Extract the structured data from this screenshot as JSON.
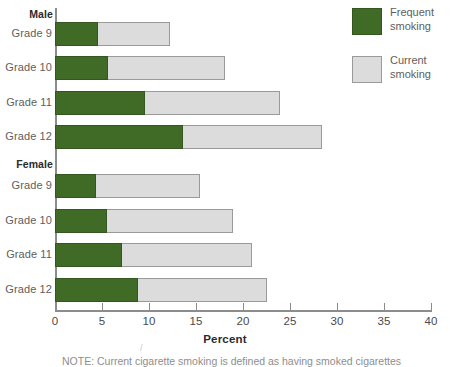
{
  "chart_data": {
    "type": "bar",
    "orientation": "horizontal",
    "stacked": true,
    "title": "",
    "xlabel": "Percent",
    "ylabel": "",
    "xlim": [
      0,
      40
    ],
    "xticks": [
      0,
      5,
      10,
      15,
      20,
      25,
      30,
      35,
      40
    ],
    "xtick_labels": [
      "0",
      "5",
      "10",
      "15",
      "20",
      "25",
      "30",
      "35",
      "40"
    ],
    "grid": false,
    "legend_position": "top-right",
    "groups": [
      {
        "name": "Male",
        "categories": [
          "Grade 9",
          "Grade 10",
          "Grade 11",
          "Grade 12"
        ]
      },
      {
        "name": "Female",
        "categories": [
          "Grade 9",
          "Grade 10",
          "Grade 11",
          "Grade 12"
        ]
      }
    ],
    "categories": [
      "Male Grade 9",
      "Male Grade 10",
      "Male Grade 11",
      "Male Grade 12",
      "Female Grade 9",
      "Female Grade 10",
      "Female Grade 11",
      "Female Grade 12"
    ],
    "series": [
      {
        "name": "Frequent smoking",
        "color": "#3f6b27",
        "values": [
          4.6,
          5.6,
          9.6,
          13.6,
          4.4,
          5.5,
          7.1,
          8.8
        ]
      },
      {
        "name": "Current smoking",
        "color": "#dcdcdc",
        "values": [
          12.2,
          18.1,
          23.9,
          28.4,
          15.4,
          18.9,
          21.0,
          22.6
        ],
        "note": "Values are cumulative bar ends (total current smoking)."
      }
    ]
  },
  "axis": {
    "xlabel": "Percent",
    "tick_labels": [
      "0",
      "5",
      "10",
      "15",
      "20",
      "25",
      "30",
      "35",
      "40"
    ]
  },
  "groups": {
    "male": {
      "header": "Male",
      "rows": [
        {
          "label": "Grade 9",
          "frequent": 4.6,
          "total": 12.2
        },
        {
          "label": "Grade 10",
          "frequent": 5.6,
          "total": 18.1
        },
        {
          "label": "Grade 11",
          "frequent": 9.6,
          "total": 23.9
        },
        {
          "label": "Grade 12",
          "frequent": 13.6,
          "total": 28.4
        }
      ]
    },
    "female": {
      "header": "Female",
      "rows": [
        {
          "label": "Grade 9",
          "frequent": 4.4,
          "total": 15.4
        },
        {
          "label": "Grade 10",
          "frequent": 5.5,
          "total": 18.9
        },
        {
          "label": "Grade 11",
          "frequent": 7.1,
          "total": 21.0
        },
        {
          "label": "Grade 12",
          "frequent": 8.8,
          "total": 22.6
        }
      ]
    }
  },
  "legend": {
    "items": [
      {
        "label": "Frequent\nsmoking",
        "color": "#3f6b27"
      },
      {
        "label": "Current\nsmoking",
        "color": "#dcdcdc"
      }
    ]
  },
  "footnote": {
    "text": "NOTE: Current cigarette smoking is defined as having smoked cigarettes"
  }
}
